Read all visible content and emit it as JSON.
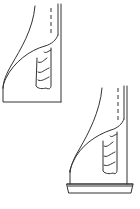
{
  "figure": {
    "stroke_color": "#333333",
    "background": "#ffffff",
    "panels": [
      {
        "id": "top",
        "label": "",
        "has_base_tray": false
      },
      {
        "id": "bottom",
        "label": "",
        "has_base_tray": true
      }
    ]
  }
}
